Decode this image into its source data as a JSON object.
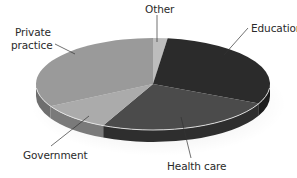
{
  "chart_data": {
    "type": "pie",
    "style": "3d-tilted-pie",
    "title": "",
    "categories": [
      "Other",
      "Education",
      "Health care",
      "Government",
      "Private practice"
    ],
    "values": [
      2,
      30,
      25,
      10,
      33
    ],
    "unit": "percent (estimated from slice angles)",
    "colors": [
      "#bdbdbd",
      "#2b2b2b",
      "#4b4b4b",
      "#ababab",
      "#9a9a9a"
    ],
    "side_colors": [
      "#8a8a8a",
      "#1c1c1c",
      "#2e2e2e",
      "#7a7a7a",
      "#6e6e6e"
    ],
    "start_angle_deg": 0,
    "direction": "clockwise",
    "legend": "none (callout labels with leader lines)",
    "labels": [
      {
        "text": "Other",
        "x": 145,
        "y": 4
      },
      {
        "text": "Education",
        "x": 252,
        "y": 23
      },
      {
        "text": "Health care",
        "x": 169,
        "y": 162
      },
      {
        "text": "Government",
        "x": 24,
        "y": 150
      },
      {
        "text": "Private\npractice",
        "x": 15,
        "y": 24
      }
    ]
  },
  "labels": {
    "other": "Other",
    "education": "Education",
    "health_care": "Health care",
    "government": "Government",
    "private_line1": "Private",
    "private_line2": "practice"
  }
}
